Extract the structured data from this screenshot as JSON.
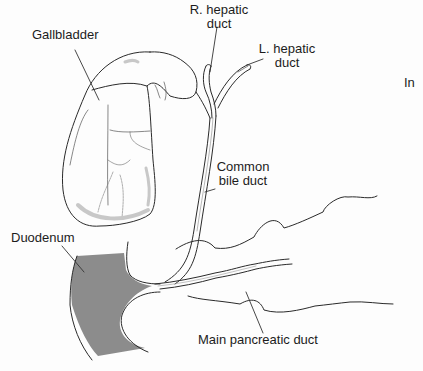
{
  "diagram": {
    "labels": {
      "gallbladder": "Gallbladder",
      "r_hepatic_duct": [
        "R. hepatic",
        "duct"
      ],
      "l_hepatic_duct": [
        "L. hepatic",
        "duct"
      ],
      "common_bile_duct": [
        "Common",
        "bile duct"
      ],
      "duodenum": "Duodenum",
      "main_pancreatic_duct": "Main pancreatic duct",
      "cut_text": "In"
    },
    "colors": {
      "line": "#2a2a2a",
      "duodenum_fill": "#8c8c8c",
      "gallbladder_shade": "#c8c8c8",
      "background": "#fdfdfd"
    }
  }
}
